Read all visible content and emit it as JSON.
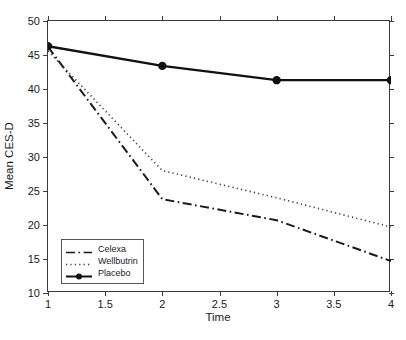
{
  "chart_data": {
    "type": "line",
    "title": "",
    "xlabel": "Time",
    "ylabel": "Mean CES-D",
    "xlim": [
      1,
      4
    ],
    "ylim": [
      10,
      50
    ],
    "xticks": [
      1,
      1.5,
      2,
      2.5,
      3,
      3.5,
      4
    ],
    "xticklabels": [
      "1",
      "1.5",
      "2",
      "2.5",
      "3",
      "3.5",
      "4"
    ],
    "yticks": [
      10,
      15,
      20,
      25,
      30,
      35,
      40,
      45,
      50
    ],
    "yticklabels": [
      "10",
      "15",
      "20",
      "25",
      "30",
      "35",
      "40",
      "45",
      "50"
    ],
    "grid": false,
    "legend_position": "lower left",
    "x": [
      1,
      2,
      3,
      4
    ],
    "series": [
      {
        "name": "Celexa",
        "values": [
          46.2,
          23.8,
          20.7,
          14.7
        ],
        "linestyle": "dash-dot",
        "marker": "none",
        "color": "#1a1a1a",
        "linewidth": 2.0
      },
      {
        "name": "Wellbutrin",
        "values": [
          45.6,
          28.0,
          24.0,
          19.7
        ],
        "linestyle": "dotted",
        "marker": "none",
        "color": "#3a3a3a",
        "linewidth": 1.6
      },
      {
        "name": "Placebo",
        "values": [
          46.3,
          43.4,
          41.3,
          41.3
        ],
        "linestyle": "solid",
        "marker": "circle",
        "color": "#111111",
        "linewidth": 2.4
      }
    ]
  },
  "legend": {
    "items": [
      {
        "label": "Celexa"
      },
      {
        "label": "Wellbutrin"
      },
      {
        "label": "Placebo"
      }
    ]
  },
  "colors": {
    "axis": "#3a3a3a",
    "text": "#1a1a1a",
    "background": "#ffffff"
  }
}
